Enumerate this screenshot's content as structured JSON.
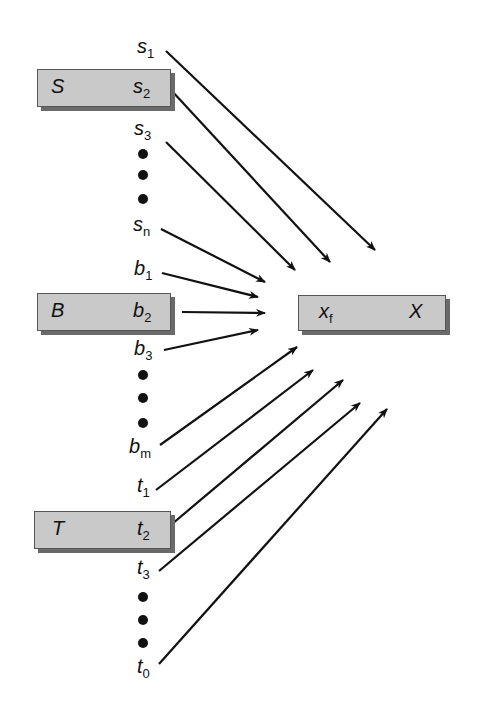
{
  "diagram": {
    "target": {
      "name": "X",
      "field": "x",
      "field_sub": "f"
    },
    "sources": [
      {
        "name": "S",
        "items": [
          {
            "var": "s",
            "sub": "1"
          },
          {
            "var": "s",
            "sub": "2"
          },
          {
            "var": "s",
            "sub": "3"
          },
          {
            "var": "s",
            "sub": "n"
          }
        ]
      },
      {
        "name": "B",
        "items": [
          {
            "var": "b",
            "sub": "1"
          },
          {
            "var": "b",
            "sub": "2"
          },
          {
            "var": "b",
            "sub": "3"
          },
          {
            "var": "b",
            "sub": "m"
          }
        ]
      },
      {
        "name": "T",
        "items": [
          {
            "var": "t",
            "sub": "1"
          },
          {
            "var": "t",
            "sub": "2"
          },
          {
            "var": "t",
            "sub": "3"
          },
          {
            "var": "t",
            "sub": "0"
          }
        ]
      }
    ],
    "colors": {
      "box_fill": "#c9c9c9",
      "box_shadow": "#6a6a6a",
      "line": "#111111"
    }
  }
}
